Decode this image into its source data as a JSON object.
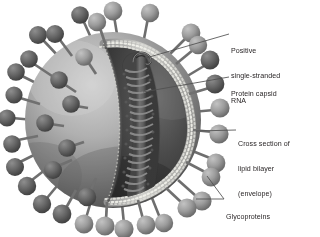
{
  "figure": {
    "background_color": "#ffffff",
    "label_color": "#231f20",
    "leader_line_color": "#4a4a4a",
    "palette": {
      "envelope_light": "#b9b9b9",
      "envelope_mid": "#8e8e8e",
      "envelope_dark": "#5c5c5c",
      "interior_dark": "#3d3d3d",
      "interior_darkest": "#2a2a2a",
      "bilayer_bead": "#d8d8d4",
      "spike_head": "#9a9a9a",
      "spike_head_dark": "#6a6a6a",
      "spike_stalk": "#707070",
      "capsid": "#6f6f6f"
    }
  },
  "labels": [
    {
      "id": "rna",
      "name": "label-positive-single-stranded-rna",
      "lines": [
        "Positive",
        "single-stranded",
        "RNA"
      ],
      "leader": {
        "from": [
          229,
          34
        ],
        "to": [
          146,
          58
        ]
      }
    },
    {
      "id": "capsid",
      "name": "label-protein-capsid",
      "lines": [
        "Protein capsid"
      ],
      "leader": {
        "from": [
          229,
          77
        ],
        "to": [
          143,
          92
        ]
      }
    },
    {
      "id": "bilayer",
      "name": "label-cross-section-lipid-bilayer",
      "lines": [
        "Cross section of",
        "lipid bilayer",
        "(envelope)"
      ],
      "leader": {
        "from": [
          236,
          130
        ],
        "to": [
          196,
          131
        ]
      }
    },
    {
      "id": "glycoproteins",
      "name": "label-glycoproteins",
      "lines": [
        "Glycoproteins"
      ],
      "leaders": [
        {
          "from": [
            224,
            199
          ],
          "to": [
            207,
            176
          ]
        },
        {
          "from": [
            224,
            199
          ],
          "to": [
            196,
            199
          ]
        }
      ]
    }
  ],
  "structures": {
    "envelope": "outer spherical lipid envelope, shaded sphere cut open on the right",
    "bilayer_rim": "beaded double row of phospholipid head groups along the cut edge",
    "nucleocapsid": "helical protein capsid coil running vertically inside the cavity",
    "rna_strand": "free positive single-stranded RNA loop at top of the capsid",
    "spikes": "mushroom-shaped glycoprotein spikes projecting from the envelope surface"
  },
  "spike_count_visible": 28
}
